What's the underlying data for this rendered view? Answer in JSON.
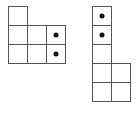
{
  "diagram": {
    "cell_size": 20,
    "line_color": "#555555",
    "dot_color": "#111111",
    "figures": [
      {
        "name": "left-shape",
        "origin": [
          8,
          6
        ],
        "cells": [
          {
            "col": 0,
            "row": 0,
            "dot": false
          },
          {
            "col": 0,
            "row": 1,
            "dot": false
          },
          {
            "col": 1,
            "row": 1,
            "dot": false
          },
          {
            "col": 2,
            "row": 1,
            "dot": true
          },
          {
            "col": 0,
            "row": 2,
            "dot": false
          },
          {
            "col": 1,
            "row": 2,
            "dot": false
          },
          {
            "col": 2,
            "row": 2,
            "dot": true
          }
        ]
      },
      {
        "name": "right-shape",
        "origin": [
          92,
          6
        ],
        "cells": [
          {
            "col": 0,
            "row": 0,
            "dot": true
          },
          {
            "col": 0,
            "row": 1,
            "dot": true
          },
          {
            "col": 0,
            "row": 2,
            "dot": false
          },
          {
            "col": 0,
            "row": 3,
            "dot": false
          },
          {
            "col": 1,
            "row": 3,
            "dot": false
          },
          {
            "col": 0,
            "row": 4,
            "dot": false
          },
          {
            "col": 1,
            "row": 4,
            "dot": false
          }
        ]
      }
    ]
  }
}
